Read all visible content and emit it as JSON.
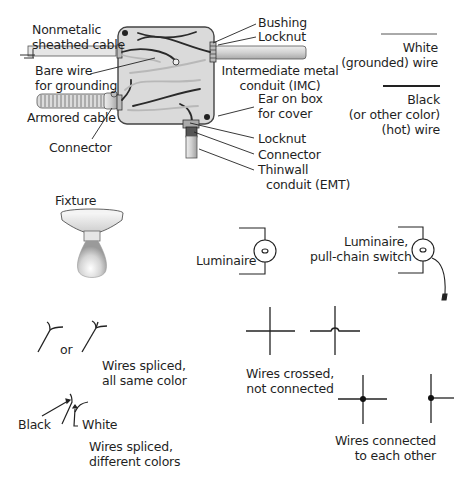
{
  "junction_box": {
    "labels": {
      "nonmetallic_line1": "Nonmetalic",
      "nonmetallic_line2": "sheathed cable",
      "bare_wire_line1": "Bare wire",
      "bare_wire_line2": "for grounding",
      "armored_cable": "Armored cable",
      "connector_left": "Connector",
      "bushing": "Bushing",
      "locknut_top": "Locknut",
      "imc_line1": "Intermediate metal",
      "imc_line2": "conduit (IMC)",
      "ear_line1": "Ear on box",
      "ear_line2": "for cover",
      "locknut_bottom": "Locknut",
      "connector_bottom": "Connector",
      "emt_line1": "Thinwall",
      "emt_line2": "conduit (EMT)"
    }
  },
  "legend": {
    "white_line1": "White",
    "white_line2": "(grounded) wire",
    "black_line1": "Black",
    "black_line2": "(or other color)",
    "black_line3": "(hot) wire"
  },
  "fixture": {
    "label": "Fixture"
  },
  "luminaire": {
    "label": "Luminaire"
  },
  "luminaire_pull": {
    "line1": "Luminaire,",
    "line2": "pull-chain switch"
  },
  "splice_same": {
    "or": "or",
    "line1": "Wires spliced,",
    "line2": "all same color"
  },
  "splice_diff": {
    "black": "Black",
    "white": "White",
    "line1": "Wires spliced,",
    "line2": "different colors"
  },
  "crossed": {
    "line1": "Wires crossed,",
    "line2": "not connected"
  },
  "connected": {
    "line1": "Wires connected",
    "line2": "to each other"
  },
  "colors": {
    "box_fill": "#d9d9d9",
    "box_stroke": "#555555",
    "wire_black": "#2a2a2a",
    "wire_white": "#bdbdbd",
    "conduit": "#cfcfcf"
  }
}
